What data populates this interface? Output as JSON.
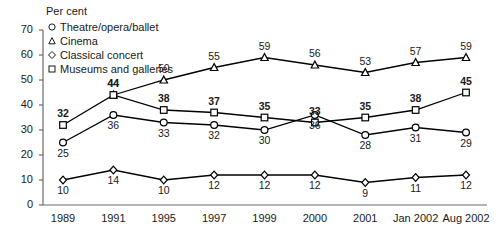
{
  "axis_title": "Per cent",
  "legend": {
    "items": [
      {
        "marker": "circle-marker",
        "label": "Theatre/opera/ballet"
      },
      {
        "marker": "triangle-marker",
        "label": "Cinema"
      },
      {
        "marker": "diamond-marker",
        "label": "Classical concert"
      },
      {
        "marker": "square-marker",
        "label": "Museums and galleries"
      }
    ]
  },
  "chart_data": {
    "type": "line",
    "title": "",
    "xlabel": "",
    "ylabel": "Per cent",
    "ylim": [
      0,
      70
    ],
    "yticks": [
      0,
      10,
      20,
      30,
      40,
      50,
      60,
      70
    ],
    "grid": false,
    "legend_position": "top-left",
    "categories": [
      "1989",
      "1991",
      "1995",
      "1997",
      "1999",
      "2000",
      "2001",
      "Jan 2002",
      "Aug 2002"
    ],
    "series": [
      {
        "name": "Theatre/opera/ballet",
        "marker": "circle",
        "label_bold": false,
        "label_position": "below",
        "values": [
          25,
          36,
          33,
          32,
          30,
          36,
          28,
          31,
          29
        ]
      },
      {
        "name": "Cinema",
        "marker": "triangle",
        "label_bold": false,
        "label_position": "above",
        "values": [
          null,
          44,
          50,
          55,
          59,
          56,
          53,
          57,
          59
        ]
      },
      {
        "name": "Classical concert",
        "marker": "diamond",
        "label_bold": false,
        "label_position": "below",
        "values": [
          10,
          14,
          10,
          12,
          12,
          12,
          9,
          11,
          12
        ]
      },
      {
        "name": "Museums and galleries",
        "marker": "square",
        "label_bold": true,
        "label_position": "above",
        "values": [
          32,
          44,
          38,
          37,
          35,
          33,
          35,
          38,
          45
        ]
      }
    ]
  },
  "colors": {
    "line": "#000000",
    "axis": "#6b6b6b",
    "text": "#1a1a1a"
  }
}
